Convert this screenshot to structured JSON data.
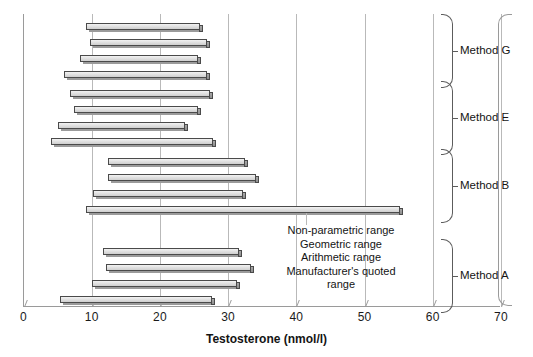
{
  "chart_data": {
    "type": "bar",
    "orientation": "horizontal",
    "title": "",
    "xlabel": "Testosterone (nmol/l)",
    "ylabel": "",
    "xlim": [
      0,
      70
    ],
    "xticks": [
      0,
      10,
      20,
      30,
      40,
      50,
      60,
      70
    ],
    "xtick_labels": [
      "0",
      "10",
      "20",
      "30",
      "40",
      "50",
      "60",
      "70"
    ],
    "grid": "vertical",
    "legend_position": "inside-center-right",
    "series_names": [
      "Non-parametric range",
      "Geometric range",
      "Arithmetic range",
      "Manufacturer's quoted range"
    ],
    "groups": [
      {
        "label": "Method G",
        "bars": [
          {
            "series": "Non-parametric range",
            "low": 9.1,
            "high": 25.7
          },
          {
            "series": "Geometric range",
            "low": 9.7,
            "high": 26.8
          },
          {
            "series": "Arithmetic range",
            "low": 8.3,
            "high": 25.5
          },
          {
            "series": "Manufacturer's quoted range",
            "low": 6.0,
            "high": 26.8
          }
        ]
      },
      {
        "label": "Method E",
        "bars": [
          {
            "series": "Non-parametric range",
            "low": 6.8,
            "high": 27.2
          },
          {
            "series": "Geometric range",
            "low": 7.4,
            "high": 25.4
          },
          {
            "series": "Arithmetic range",
            "low": 5.1,
            "high": 23.6
          },
          {
            "series": "Manufacturer's quoted range",
            "low": 4.1,
            "high": 27.6
          }
        ]
      },
      {
        "label": "Method B",
        "bars": [
          {
            "series": "Non-parametric range",
            "low": 12.4,
            "high": 32.4
          },
          {
            "series": "Geometric range",
            "low": 12.4,
            "high": 34.0
          },
          {
            "series": "Arithmetic range",
            "low": 10.2,
            "high": 32.1
          },
          {
            "series": "Manufacturer's quoted range",
            "low": 9.1,
            "high": 55.0
          }
        ]
      },
      {
        "label": "Method A",
        "bars": [
          {
            "series": "Non-parametric range",
            "low": 11.6,
            "high": 31.5
          },
          {
            "series": "Geometric range",
            "low": 12.1,
            "high": 33.2
          },
          {
            "series": "Arithmetic range",
            "low": 10.1,
            "high": 31.2
          },
          {
            "series": "Manufacturer's quoted range",
            "low": 5.4,
            "high": 27.5
          }
        ]
      }
    ],
    "annotation_legend": [
      "Non-parametric range",
      "Geometric range",
      "Arithmetic range",
      "Manufacturer's quoted",
      "range"
    ],
    "colors": {
      "bar_face": "#e2e2e2",
      "bar_edge": "#4a4a4a",
      "bar_side": "#8e8e8e",
      "grid": "#b9b9b9",
      "axis": "#9a9a9a",
      "text": "#141414",
      "background": "#ffffff"
    }
  }
}
